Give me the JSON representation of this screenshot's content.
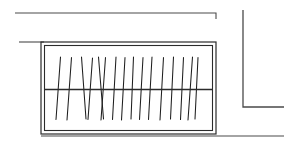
{
  "figure": {
    "type": "technical-line-drawing",
    "width": 284,
    "height": 145,
    "background_color": "#ffffff",
    "line_color": "#2b2b2b",
    "hatch_color": "#1f1f1f",
    "reference_line_color": "#4a4a4a"
  },
  "geometry": {
    "outer_rect": {
      "x": 41,
      "y": 42,
      "width": 175,
      "height": 92,
      "stroke_width": 1.2
    },
    "inner_rect": {
      "x": 44.5,
      "y": 45.5,
      "width": 168,
      "height": 85,
      "stroke_width": 1.1
    },
    "divider_line": {
      "x1": 44.5,
      "y1": 89.5,
      "x2": 212.5,
      "y2": 89.5,
      "stroke_width": 1.4
    },
    "reference_lines": [
      {
        "name": "top-extension-line",
        "points": "15,13 216,13 216,19",
        "stroke_width": 1.1
      },
      {
        "name": "upper-left-extension-line",
        "points": "19,42 44,42",
        "stroke_width": 1.1
      },
      {
        "name": "right-vertical-extension-line",
        "points": "243,10 243,107 284,107",
        "stroke_width": 1.3
      },
      {
        "name": "bottom-baseline",
        "points": "41,136 284,136",
        "stroke_width": 1.1
      }
    ],
    "hatch_lines": [
      {
        "x1": 60.5,
        "y1": 57.0,
        "x2": 56.0,
        "y2": 119.5
      },
      {
        "x1": 71.5,
        "y1": 57.5,
        "x2": 67.0,
        "y2": 120.0
      },
      {
        "x1": 81.5,
        "y1": 57.0,
        "x2": 86.0,
        "y2": 119.0
      },
      {
        "x1": 92.5,
        "y1": 58.0,
        "x2": 88.0,
        "y2": 119.5
      },
      {
        "x1": 98.5,
        "y1": 57.0,
        "x2": 103.5,
        "y2": 119.0
      },
      {
        "x1": 105.5,
        "y1": 57.5,
        "x2": 101.0,
        "y2": 120.0
      },
      {
        "x1": 116.0,
        "y1": 57.0,
        "x2": 112.5,
        "y2": 119.5
      },
      {
        "x1": 125.0,
        "y1": 57.5,
        "x2": 121.5,
        "y2": 120.0
      },
      {
        "x1": 133.5,
        "y1": 57.0,
        "x2": 131.0,
        "y2": 119.0
      },
      {
        "x1": 143.0,
        "y1": 57.5,
        "x2": 139.5,
        "y2": 119.5
      },
      {
        "x1": 152.0,
        "y1": 57.0,
        "x2": 148.5,
        "y2": 119.5
      },
      {
        "x1": 163.5,
        "y1": 57.5,
        "x2": 160.0,
        "y2": 120.0
      },
      {
        "x1": 173.5,
        "y1": 57.0,
        "x2": 170.5,
        "y2": 119.0
      },
      {
        "x1": 183.5,
        "y1": 57.5,
        "x2": 180.5,
        "y2": 119.5
      },
      {
        "x1": 192.5,
        "y1": 57.0,
        "x2": 188.0,
        "y2": 120.0
      },
      {
        "x1": 198.0,
        "y1": 57.5,
        "x2": 195.0,
        "y2": 119.0
      }
    ]
  }
}
